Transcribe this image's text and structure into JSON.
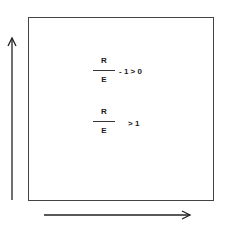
{
  "diagram": {
    "inequality_1": {
      "numerator": "R",
      "denominator": "E",
      "tail": "- 1 > 0"
    },
    "inequality_2": {
      "numerator": "R",
      "denominator": "E",
      "tail": "> 1"
    },
    "arrows": {
      "vertical": "up-arrow",
      "horizontal": "right-arrow"
    }
  }
}
